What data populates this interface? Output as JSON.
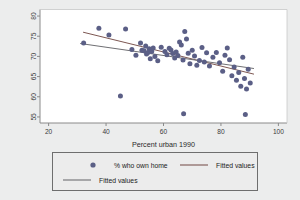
{
  "chart_data": {
    "type": "scatter",
    "title": "",
    "subtitle": "",
    "xlabel": "Percent urban 1990",
    "ylabel": "",
    "xlim": [
      17,
      103
    ],
    "ylim": [
      53.5,
      81.5
    ],
    "xticks": [
      20,
      40,
      60,
      80,
      100
    ],
    "yticks": [
      55,
      60,
      65,
      70,
      75,
      80
    ],
    "grid": false,
    "legend_position": "below",
    "marker_color": "#5b5f86",
    "marker_shape": "circle",
    "series": [
      {
        "name": "% who own home",
        "type": "scatter",
        "color": "#5b5f86",
        "points": [
          [
            32.2,
            73.3
          ],
          [
            37.5,
            77.0
          ],
          [
            41.0,
            75.3
          ],
          [
            46.8,
            76.8
          ],
          [
            49.0,
            71.7
          ],
          [
            50.4,
            70.3
          ],
          [
            52.0,
            73.3
          ],
          [
            52.5,
            71.5
          ],
          [
            53.2,
            71.4
          ],
          [
            53.8,
            72.6
          ],
          [
            54.1,
            70.6
          ],
          [
            54.6,
            71.0
          ],
          [
            55.0,
            71.9
          ],
          [
            55.4,
            69.4
          ],
          [
            55.9,
            71.2
          ],
          [
            56.4,
            72.1
          ],
          [
            57.0,
            70.0
          ],
          [
            58.0,
            68.9
          ],
          [
            59.2,
            72.3
          ],
          [
            60.5,
            71.2
          ],
          [
            61.2,
            70.4
          ],
          [
            62.0,
            72.0
          ],
          [
            62.6,
            71.6
          ],
          [
            63.2,
            70.7
          ],
          [
            63.9,
            69.6
          ],
          [
            64.4,
            71.1
          ],
          [
            65.0,
            70.2
          ],
          [
            65.6,
            73.6
          ],
          [
            66.2,
            72.8
          ],
          [
            66.8,
            69.1
          ],
          [
            67.4,
            76.2
          ],
          [
            68.0,
            74.3
          ],
          [
            68.6,
            70.8
          ],
          [
            69.2,
            68.2
          ],
          [
            70.0,
            71.5
          ],
          [
            70.8,
            70.1
          ],
          [
            71.6,
            67.8
          ],
          [
            72.5,
            69.0
          ],
          [
            73.4,
            72.2
          ],
          [
            74.2,
            68.6
          ],
          [
            75.0,
            70.9
          ],
          [
            76.0,
            67.6
          ],
          [
            77.2,
            69.8
          ],
          [
            78.4,
            71.0
          ],
          [
            79.5,
            68.4
          ],
          [
            80.6,
            66.3
          ],
          [
            81.4,
            70.3
          ],
          [
            82.2,
            72.1
          ],
          [
            83.0,
            69.2
          ],
          [
            83.8,
            65.2
          ],
          [
            84.6,
            67.4
          ],
          [
            85.4,
            64.1
          ],
          [
            86.2,
            66.0
          ],
          [
            86.9,
            62.6
          ],
          [
            87.6,
            69.8
          ],
          [
            88.2,
            64.5
          ],
          [
            88.9,
            61.9
          ],
          [
            89.5,
            66.8
          ],
          [
            90.2,
            63.4
          ],
          [
            67.0,
            55.8
          ],
          [
            88.5,
            55.6
          ],
          [
            45.0,
            60.2
          ]
        ]
      },
      {
        "name": "Fitted values",
        "type": "line",
        "color": "#7d5752",
        "points": [
          [
            32.0,
            76.0
          ],
          [
            91.5,
            65.6
          ]
        ]
      },
      {
        "name": "Fitted values",
        "type": "line",
        "color": "#6f6f73",
        "points": [
          [
            31.0,
            73.2
          ],
          [
            91.5,
            67.0
          ]
        ]
      }
    ]
  },
  "legend": {
    "entries": [
      {
        "label": "% who own home",
        "kind": "marker",
        "color": "#5b5f86"
      },
      {
        "label": "Fitted values",
        "kind": "line",
        "color": "#7d5752"
      },
      {
        "label": "Fitted values",
        "kind": "line",
        "color": "#6f6f73"
      }
    ]
  },
  "colors": {
    "background": "#eceded",
    "plot_background": "#ffffff",
    "axis": "#8a8a8a",
    "legend_border": "#6e6e6e",
    "legend_background": "#ececec",
    "marker": "#5b5f86",
    "fit_line_1": "#7d5752",
    "fit_line_2": "#6f6f73",
    "text": "#2a2a2a"
  }
}
